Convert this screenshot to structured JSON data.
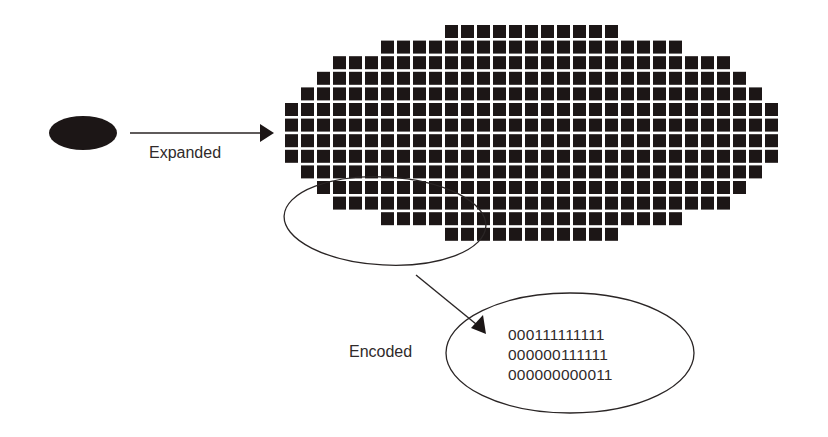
{
  "diagram": {
    "labels": {
      "expanded": "Expanded",
      "encoded": "Encoded"
    },
    "source_shape": {
      "type": "filled-ellipse",
      "cx": 83,
      "cy": 133,
      "rx": 34,
      "ry": 17
    },
    "grid": {
      "origin_x": 285,
      "origin_y": 25,
      "pitch_x": 16,
      "pitch_y": 15.6,
      "cell_size": 13,
      "cell_color": "#1c1616",
      "rows": [
        {
          "start": 10,
          "end": 20
        },
        {
          "start": 6,
          "end": 24
        },
        {
          "start": 3,
          "end": 27
        },
        {
          "start": 2,
          "end": 28
        },
        {
          "start": 1,
          "end": 29
        },
        {
          "start": 0,
          "end": 30
        },
        {
          "start": 0,
          "end": 30
        },
        {
          "start": 0,
          "end": 30
        },
        {
          "start": 0,
          "end": 30
        },
        {
          "start": 1,
          "end": 29
        },
        {
          "start": 2,
          "end": 28
        },
        {
          "start": 3,
          "end": 27
        },
        {
          "start": 6,
          "end": 24
        },
        {
          "start": 10,
          "end": 20
        }
      ]
    },
    "highlight_ellipse": {
      "cx": 385,
      "cy": 221,
      "rx": 101,
      "ry": 44
    },
    "encoded_ellipse": {
      "cx": 570,
      "cy": 353,
      "rx": 124,
      "ry": 60
    },
    "encoded_lines": [
      "000111111111",
      "000000111111",
      "000000000011"
    ],
    "colors": {
      "background": "#ffffff",
      "ink": "#2a2525",
      "fill": "#1c1616"
    }
  }
}
